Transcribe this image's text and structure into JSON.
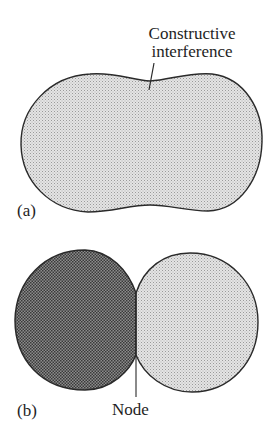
{
  "figure": {
    "panels": [
      {
        "id": "a",
        "label": "(a)",
        "shape": "single dumbbell/peanut-shaped lobe",
        "fill": "light stipple",
        "annotation": {
          "line1": "Constructive",
          "line2": "interference"
        }
      },
      {
        "id": "b",
        "label": "(b)",
        "shape": "two lobes meeting at a node",
        "left_lobe_fill": "dark stipple",
        "right_lobe_fill": "light stipple",
        "annotation": {
          "text": "Node"
        }
      }
    ],
    "colors": {
      "outline": "#2a2a2a",
      "light_fill": "#d6d6d6",
      "light_dot": "#9a9a9a",
      "dark_fill": "#7a7a7a",
      "dark_dot": "#333333",
      "text": "#1e1e1e"
    }
  }
}
